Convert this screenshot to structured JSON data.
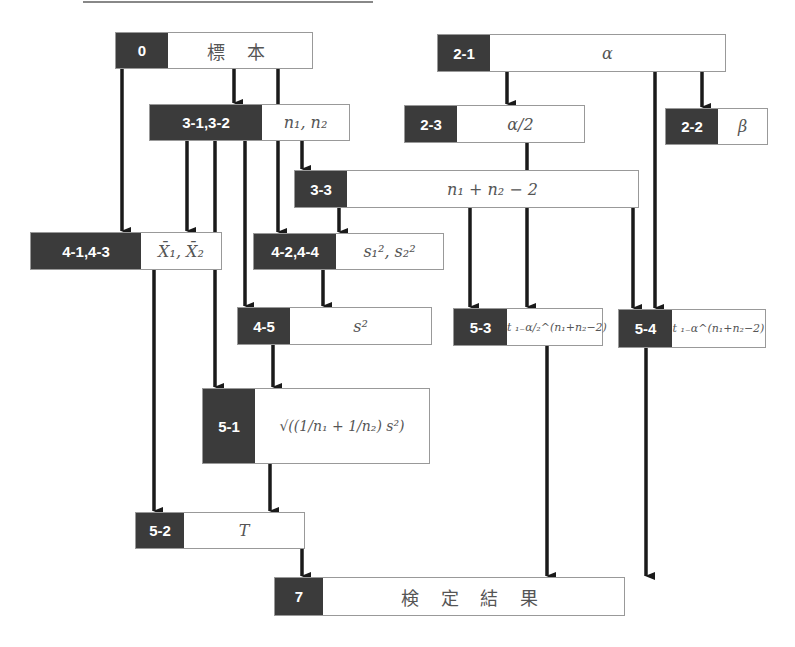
{
  "nodes": [
    {
      "id": "0",
      "label": "0",
      "value": "標 本"
    },
    {
      "id": "2-1",
      "label": "2-1",
      "value": "α"
    },
    {
      "id": "3-1",
      "label": "3-1,3-2",
      "value": "n₁,  n₂"
    },
    {
      "id": "2-3",
      "label": "2-3",
      "value": "α/2"
    },
    {
      "id": "2-2",
      "label": "2-2",
      "value": "β"
    },
    {
      "id": "3-3",
      "label": "3-3",
      "value": "n₁ + n₂ − 2"
    },
    {
      "id": "4-1",
      "label": "4-1,4-3",
      "value": "X̄₁,  X̄₂"
    },
    {
      "id": "4-2",
      "label": "4-2,4-4",
      "value": "s₁²,  s₂²"
    },
    {
      "id": "4-5",
      "label": "4-5",
      "value": "s²"
    },
    {
      "id": "5-3",
      "label": "5-3",
      "value": "t ₁₋α/₂^(n₁+n₂−2)"
    },
    {
      "id": "5-4",
      "label": "5-4",
      "value": "t ₁₋α^(n₁+n₂−2)"
    },
    {
      "id": "5-1",
      "label": "5-1",
      "value": "√((1/n₁ + 1/n₂) s²)"
    },
    {
      "id": "5-2",
      "label": "5-2",
      "value": "T"
    },
    {
      "id": "7",
      "label": "7",
      "value": "検 定 結 果"
    }
  ],
  "colors": {
    "label_fill": "#3b3b3b",
    "label_text": "#ffffff",
    "edge": "#1a1a1a"
  }
}
